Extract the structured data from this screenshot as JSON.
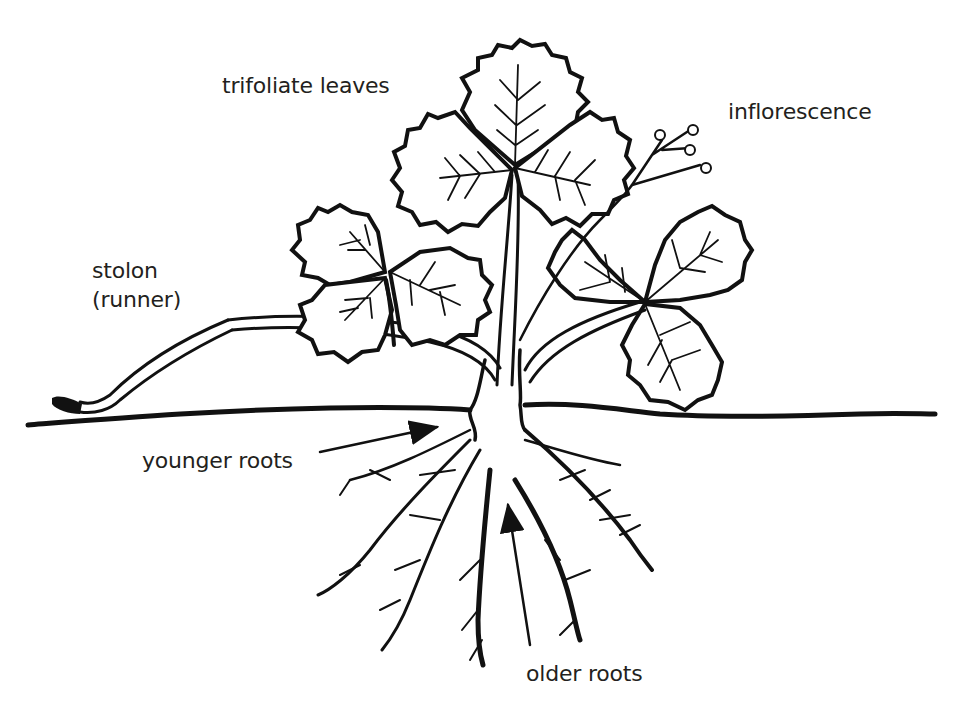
{
  "diagram": {
    "labels": {
      "trifoliate_leaves": "trifoliate leaves",
      "inflorescence": "inflorescence",
      "stolon_line1": "stolon",
      "stolon_line2": "(runner)",
      "younger_roots": "younger roots",
      "older_roots": "older roots"
    },
    "colors": {
      "ink": "#111111",
      "label_text": "#231f20",
      "background": "#ffffff"
    }
  }
}
